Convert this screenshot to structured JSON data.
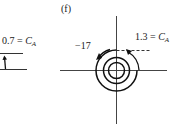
{
  "figure": {
    "panel_label": "(f)",
    "left": {
      "value": "0.7",
      "equals": "=",
      "symbol": "C",
      "subscript": "A"
    },
    "right": {
      "neg_value": "−17",
      "value": "1.3",
      "equals": "=",
      "symbol": "C",
      "subscript": "A"
    },
    "colors": {
      "ink": "#1a1a1a",
      "axis": "#555555"
    }
  }
}
